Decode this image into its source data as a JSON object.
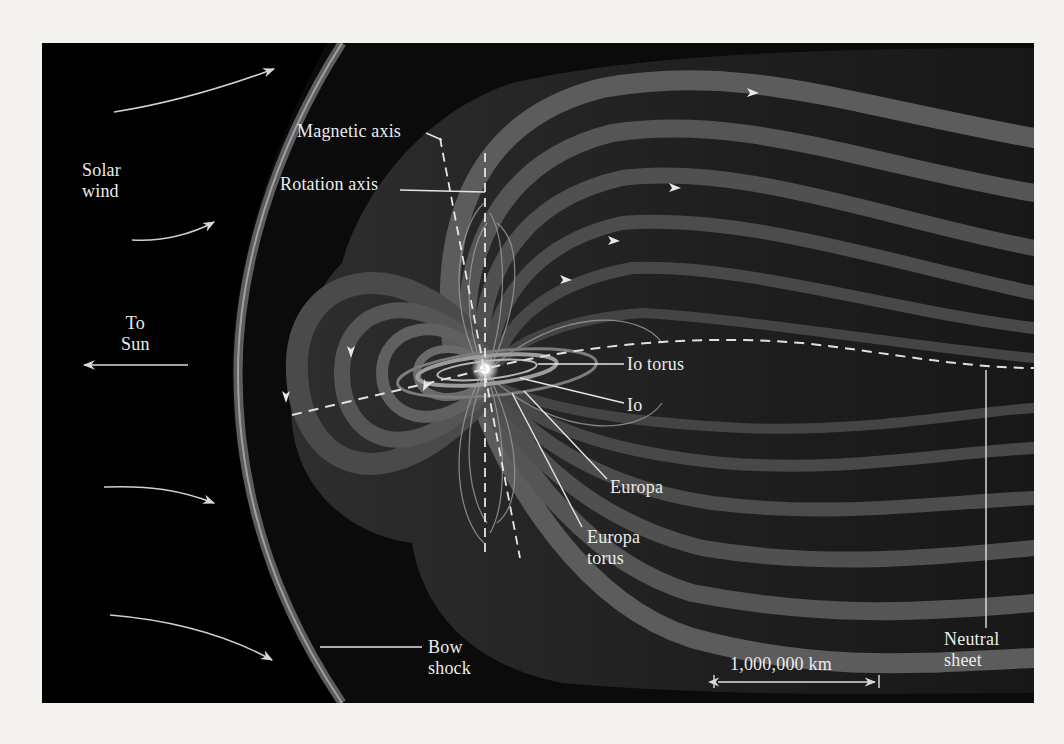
{
  "figure": {
    "background_color": "#000000",
    "page_color": "#f4f3f0",
    "field_line_color": "#8a8a8a",
    "label_color": "#ececec"
  },
  "labels": {
    "solar_wind": {
      "line1": "Solar",
      "line2": "wind"
    },
    "to_sun": {
      "line1": "To",
      "line2": "Sun"
    },
    "magnetic_axis": "Magnetic axis",
    "rotation_axis": "Rotation axis",
    "io_torus": "Io torus",
    "io": "Io",
    "europa": "Europa",
    "europa_torus": {
      "line1": "Europa",
      "line2": "torus"
    },
    "bow_shock": {
      "line1": "Bow",
      "line2": "shock"
    },
    "neutral_sheet": {
      "line1": "Neutral",
      "line2": "sheet"
    },
    "scale_bar": "1,000,000 km"
  }
}
